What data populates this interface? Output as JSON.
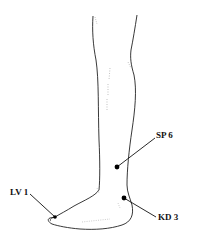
{
  "diagram": {
    "points": [
      {
        "id": "sp6",
        "label": "SP 6",
        "dot": [
          117,
          167
        ],
        "label_pos": [
          157,
          131
        ]
      },
      {
        "id": "kd3",
        "label": "KD 3",
        "dot": [
          124,
          198
        ],
        "label_pos": [
          158,
          213
        ]
      },
      {
        "id": "lv1",
        "label": "LV 1",
        "dot": [
          55,
          217
        ],
        "label_pos": [
          10,
          188
        ]
      }
    ],
    "colors": {
      "line": "#222222",
      "dot": "#000000",
      "background": "#ffffff"
    }
  }
}
